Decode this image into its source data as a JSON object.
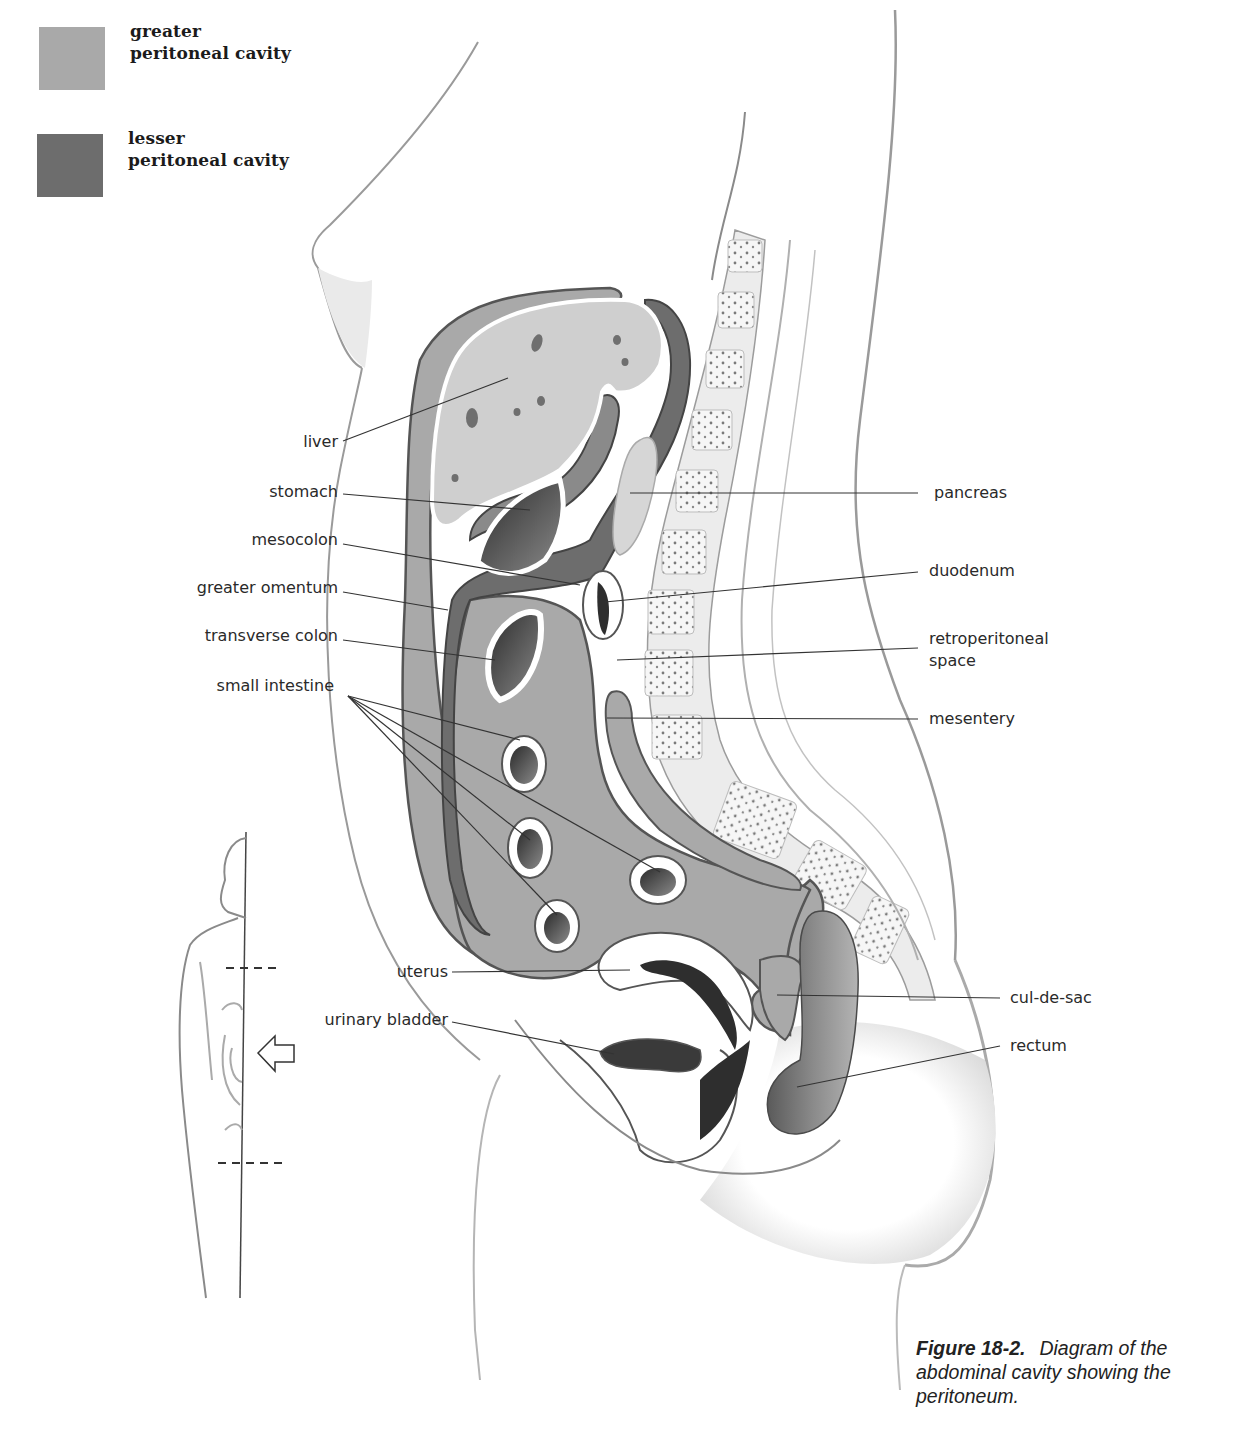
{
  "legend": {
    "items": [
      {
        "line1": "greater",
        "line2": "peritoneal cavity",
        "color": "#a9a9a9"
      },
      {
        "line1": "lesser",
        "line2": "peritoneal cavity",
        "color": "#6d6d6d"
      }
    ]
  },
  "labels": {
    "left": [
      {
        "id": "liver",
        "text": "liver"
      },
      {
        "id": "stomach",
        "text": "stomach"
      },
      {
        "id": "mesocolon",
        "text": "mesocolon"
      },
      {
        "id": "greater_omentum",
        "text": "greater omentum"
      },
      {
        "id": "transverse_colon",
        "text": "transverse colon"
      },
      {
        "id": "small_intestine",
        "text": "small intestine"
      },
      {
        "id": "uterus",
        "text": "uterus"
      },
      {
        "id": "urinary_bladder",
        "text": "urinary bladder"
      }
    ],
    "right": [
      {
        "id": "pancreas",
        "text": "pancreas"
      },
      {
        "id": "duodenum",
        "text": "duodenum"
      },
      {
        "id": "retroperitoneal_space_1",
        "text": "retroperitoneal"
      },
      {
        "id": "retroperitoneal_space_2",
        "text": "space"
      },
      {
        "id": "mesentery",
        "text": "mesentery"
      },
      {
        "id": "cul_de_sac",
        "text": "cul-de-sac"
      },
      {
        "id": "rectum",
        "text": "rectum"
      }
    ]
  },
  "inset": {
    "description": "female silhouette with section lines",
    "arrow_icon": "hollow-arrow-left"
  },
  "caption": {
    "figure_number": "Figure 18-2.",
    "text": "Diagram of the abdominal cavity showing the peritoneum."
  },
  "colors": {
    "greater_cavity": "#a9a9a9",
    "lesser_cavity": "#6d6d6d",
    "liver": "#cfcfcf",
    "outline": "#555555",
    "leader_line": "#333333"
  }
}
